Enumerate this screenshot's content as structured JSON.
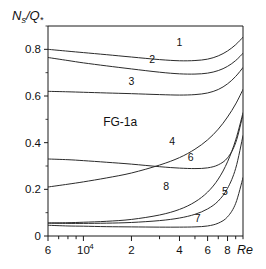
{
  "chart_data": {
    "type": "line",
    "title": "",
    "annotation": "FG-1a",
    "xlabel": "Re",
    "ylabel": "Ns/Q*",
    "ylabel_parts": {
      "main": "N",
      "main_sub": "s",
      "sep": "/",
      "second": "Q",
      "second_sub": "*"
    },
    "xscale": "log",
    "xlim": [
      6000,
      100000
    ],
    "ylim": [
      0,
      0.9
    ],
    "grid": false,
    "legend": "inline-curve-numbers",
    "yticks": [
      0,
      0.2,
      0.4,
      0.6,
      0.8
    ],
    "ytick_labels": [
      "0",
      "0.2",
      "0.4",
      "0.6",
      "0.8"
    ],
    "xticks": [
      6000,
      7000,
      8000,
      9000,
      10000,
      20000,
      30000,
      40000,
      50000,
      60000,
      70000,
      80000,
      90000,
      100000
    ],
    "xtick_labels": [
      {
        "value": 6000,
        "label": "6",
        "exp": ""
      },
      {
        "value": 10000,
        "label": "10",
        "exp": "4"
      },
      {
        "value": 20000,
        "label": "2",
        "exp": ""
      },
      {
        "value": 40000,
        "label": "4",
        "exp": ""
      },
      {
        "value": 60000,
        "label": "6",
        "exp": ""
      },
      {
        "value": 80000,
        "label": "8",
        "exp": ""
      }
    ],
    "x": [
      6000,
      8000,
      10000,
      14000,
      20000,
      30000,
      40000,
      50000,
      60000,
      70000,
      80000,
      90000,
      100000
    ],
    "series": [
      {
        "name": "1",
        "label": "1",
        "label_x": 40000,
        "label_y": 0.815,
        "values": [
          0.8,
          0.792,
          0.786,
          0.777,
          0.767,
          0.756,
          0.751,
          0.752,
          0.758,
          0.772,
          0.793,
          0.82,
          0.852
        ]
      },
      {
        "name": "2",
        "label": "2",
        "label_x": 27000,
        "label_y": 0.742,
        "values": [
          0.765,
          0.752,
          0.742,
          0.729,
          0.716,
          0.702,
          0.695,
          0.694,
          0.698,
          0.709,
          0.727,
          0.752,
          0.783
        ]
      },
      {
        "name": "3",
        "label": "3",
        "label_x": 20000,
        "label_y": 0.648,
        "values": [
          0.62,
          0.618,
          0.616,
          0.613,
          0.61,
          0.606,
          0.604,
          0.606,
          0.613,
          0.628,
          0.652,
          0.684,
          0.722
        ]
      },
      {
        "name": "4",
        "label": "4",
        "label_x": 36000,
        "label_y": 0.392,
        "values": [
          0.21,
          0.222,
          0.232,
          0.249,
          0.27,
          0.304,
          0.336,
          0.372,
          0.412,
          0.458,
          0.51,
          0.566,
          0.628
        ]
      },
      {
        "name": "5",
        "label": "5",
        "label_x": 77000,
        "label_y": 0.175,
        "values": [
          0.055,
          0.054,
          0.054,
          0.055,
          0.058,
          0.066,
          0.077,
          0.093,
          0.116,
          0.15,
          0.204,
          0.29,
          0.43
        ]
      },
      {
        "name": "6",
        "label": "6",
        "label_x": 47000,
        "label_y": 0.32,
        "values": [
          0.33,
          0.327,
          0.323,
          0.316,
          0.308,
          0.297,
          0.291,
          0.289,
          0.292,
          0.305,
          0.335,
          0.4,
          0.52
        ]
      },
      {
        "name": "7",
        "label": "7",
        "label_x": 52000,
        "label_y": 0.058,
        "values": [
          0.046,
          0.043,
          0.042,
          0.04,
          0.039,
          0.038,
          0.038,
          0.039,
          0.043,
          0.055,
          0.082,
          0.14,
          0.25
        ]
      },
      {
        "name": "8",
        "label": "8",
        "label_x": 33000,
        "label_y": 0.196,
        "values": [
          0.056,
          0.057,
          0.059,
          0.063,
          0.071,
          0.09,
          0.114,
          0.146,
          0.188,
          0.244,
          0.318,
          0.412,
          0.528
        ]
      }
    ]
  }
}
